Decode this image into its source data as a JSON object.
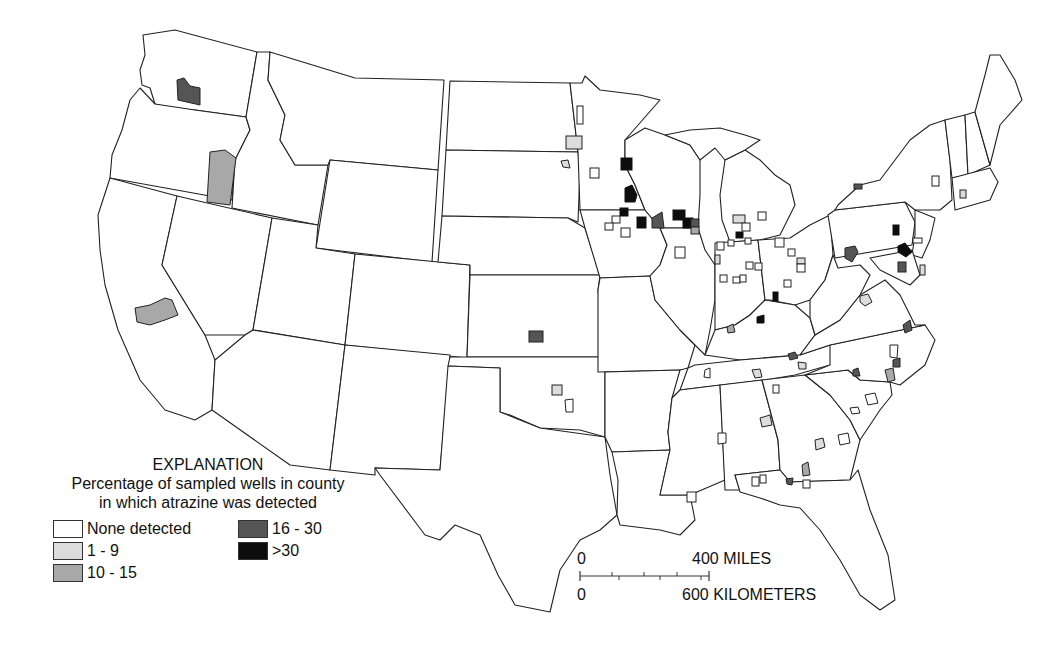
{
  "legend": {
    "title": "EXPLANATION",
    "subtitle_line1": "Percentage of sampled wells in county",
    "subtitle_line2": "in which atrazine was detected",
    "classes": [
      {
        "label": "None detected",
        "color": "#ffffff"
      },
      {
        "label": "1 - 9",
        "color": "#dcdcdc"
      },
      {
        "label": "10 - 15",
        "color": "#a8a8a8"
      },
      {
        "label": "16 - 30",
        "color": "#555555"
      },
      {
        "label": ">30",
        "color": "#0d0d0d"
      }
    ]
  },
  "scale_bar": {
    "miles_zero": "0",
    "miles_label": "400 MILES",
    "km_zero": "0",
    "km_label": "600 KILOMETERS"
  }
}
